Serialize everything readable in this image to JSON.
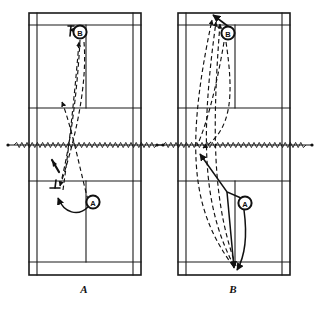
{
  "figure": {
    "type": "badminton-court-tactics-diagram",
    "background_color": "#ffffff",
    "line_color": "#1a1a1a",
    "stroke_color": "#111111",
    "width": 319,
    "height": 311
  },
  "panels": [
    {
      "id": "panel-a",
      "label": "A",
      "label_x": 84,
      "label_y": 291,
      "court": {
        "left": 29,
        "right": 141,
        "top": 13,
        "bottom": 275,
        "net_y": 145,
        "center_x": 86,
        "singles_left_x": 37,
        "singles_right_x": 133,
        "long_service_top_y": 25,
        "long_service_bottom_y": 262,
        "short_service_top_y": 108,
        "short_service_bottom_y": 181
      },
      "players": [
        {
          "id": "player-b-marker",
          "label": "B",
          "cx": 80,
          "cy": 32,
          "r": 7
        },
        {
          "id": "player-a-marker",
          "label": "A",
          "cx": 93,
          "cy": 202,
          "r": 7
        }
      ],
      "rackets": [
        {
          "id": "racket-upper",
          "x": 70,
          "y": 28,
          "angle": -8
        },
        {
          "id": "racket-lower-left",
          "x": 55,
          "y": 189,
          "angle": 6
        },
        {
          "id": "racket-net",
          "x": 56,
          "y": 173,
          "angle": 28
        }
      ],
      "solid_arrows": [
        {
          "id": "movement-arrow-a",
          "from_x": 90,
          "from_y": 206,
          "to_x": 57,
          "to_y": 196
        },
        {
          "id": "movement-arrow-b",
          "from_x": 84,
          "from_y": 32,
          "to_x": 70,
          "to_y": 29
        }
      ],
      "shuttle_paths": [
        {
          "id": "path-1",
          "desc": "high clear from rear court to forecourt"
        },
        {
          "id": "path-2",
          "desc": "return lift crossing toward rear court"
        },
        {
          "id": "path-3",
          "desc": "drop shot to net"
        }
      ]
    },
    {
      "id": "panel-b",
      "label": "B",
      "label_x": 233,
      "label_y": 291,
      "court": {
        "left": 178,
        "right": 290,
        "top": 13,
        "bottom": 275,
        "net_y": 145,
        "center_x": 235,
        "singles_left_x": 186,
        "singles_right_x": 282,
        "long_service_top_y": 25,
        "long_service_bottom_y": 262,
        "short_service_top_y": 108,
        "short_service_bottom_y": 181
      },
      "players": [
        {
          "id": "player-b-marker",
          "label": "B",
          "cx": 228,
          "cy": 33,
          "r": 7
        },
        {
          "id": "player-a-marker",
          "label": "A",
          "cx": 245,
          "cy": 203,
          "r": 7
        }
      ],
      "rackets": [],
      "solid_arrows": [
        {
          "id": "movement-arrow-b",
          "from_x": 228,
          "from_y": 28,
          "to_x": 212,
          "to_y": 16
        },
        {
          "id": "movement-arrow-net",
          "from_x": 225,
          "from_y": 196,
          "to_x": 200,
          "to_y": 152
        },
        {
          "id": "movement-arrow-rear",
          "from_x": 243,
          "from_y": 197,
          "to_x": 236,
          "to_y": 270
        }
      ],
      "shuttle_paths": [
        {
          "id": "path-1",
          "desc": "clear from rear court to opposite rear court"
        },
        {
          "id": "path-2",
          "desc": "clear returned along centre"
        },
        {
          "id": "path-3",
          "desc": "lift from forecourt to rear court"
        },
        {
          "id": "path-4",
          "desc": "drop / net shot curve"
        }
      ]
    }
  ],
  "net": {
    "style": "zigzag",
    "y": 145,
    "segments": [
      {
        "id": "net-a",
        "x_start": 8,
        "x_end": 163
      },
      {
        "id": "net-b",
        "x_start": 157,
        "x_end": 312
      }
    ]
  }
}
